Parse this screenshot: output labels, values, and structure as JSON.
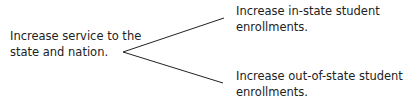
{
  "diagram": {
    "type": "tree",
    "root": {
      "line1": "Increase service to the",
      "line2": "state and nation."
    },
    "children": [
      {
        "line1": "Increase in-state student",
        "line2": "enrollments."
      },
      {
        "line1": "Increase out-of-state student",
        "line2": "enrollments."
      }
    ],
    "colors": {
      "text": "#222222",
      "line": "#222222",
      "background": "#ffffff"
    }
  }
}
